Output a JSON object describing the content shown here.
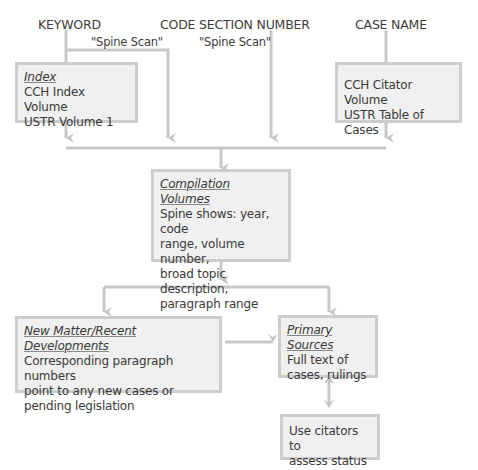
{
  "sources": {
    "keyword": "KEYWORD",
    "code_section": "CODE SECTION NUMBER",
    "case_name": "CASE NAME",
    "spine_scan_left": "\"Spine Scan\"",
    "spine_scan_center": "\"Spine Scan\""
  },
  "boxes": {
    "index": {
      "title": "Index",
      "lines": [
        "CCH Index Volume",
        "USTR Volume 1"
      ]
    },
    "citator": {
      "lines": [
        "CCH Citator Volume",
        "USTR Table of Cases"
      ]
    },
    "compilation": {
      "title": "Compilation Volumes",
      "lines": [
        "Spine shows: year, code",
        "range, volume number,",
        "broad topic description,",
        "paragraph range"
      ]
    },
    "new_matter": {
      "title": "New Matter/Recent Developments",
      "lines": [
        "Corresponding paragraph numbers",
        "point to any new cases or",
        "pending legislation"
      ]
    },
    "primary": {
      "title": "Primary Sources",
      "lines": [
        "Full text of",
        "cases, rulings"
      ]
    },
    "citators": {
      "lines": [
        "Use citators to",
        "assess status"
      ]
    }
  },
  "colors": {
    "line": "#c8c8c8",
    "box_fill": "#f0f0f0",
    "box_border": "#cdcdcd",
    "text": "#3a3a3a"
  }
}
